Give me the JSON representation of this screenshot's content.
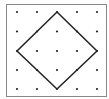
{
  "diagram": {
    "type": "geoboard",
    "grid": {
      "rows": 5,
      "cols": 5
    },
    "colors": {
      "border": "#888888",
      "dot": "#222222",
      "shape": "#222222",
      "background": "#ffffff"
    },
    "shape": {
      "name": "square",
      "vertices_grid": [
        [
          2,
          0
        ],
        [
          4,
          2
        ],
        [
          2,
          4
        ],
        [
          0,
          2
        ]
      ]
    }
  }
}
